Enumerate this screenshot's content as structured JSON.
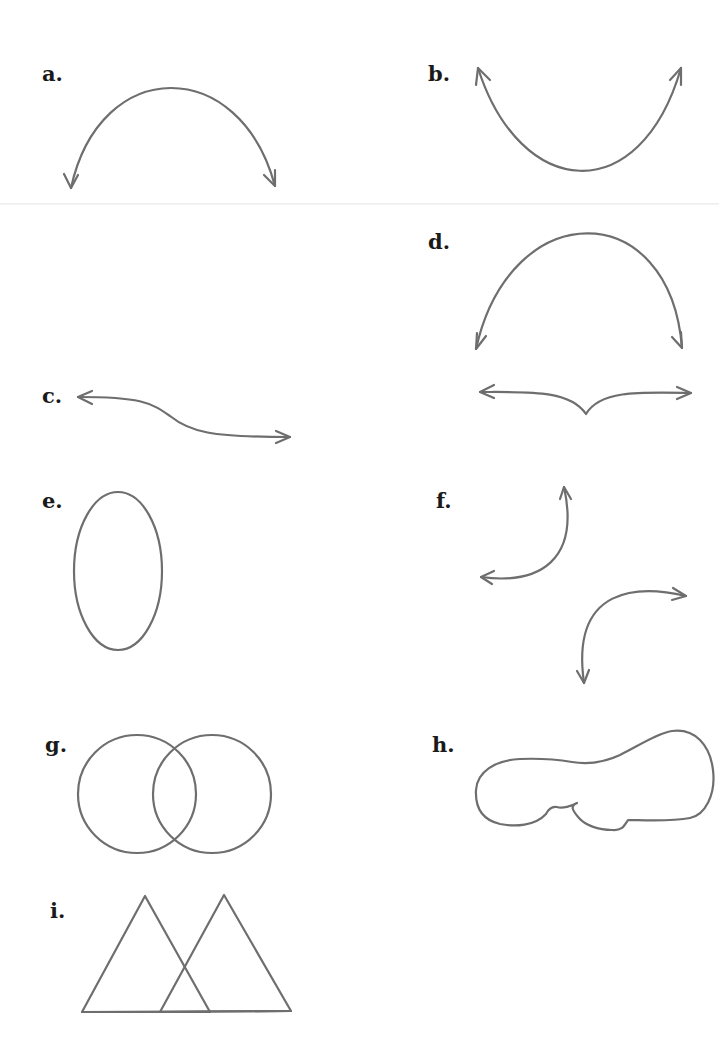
{
  "figures": [
    {
      "id": "a",
      "label": "a.",
      "shape": "downward-opening arc with arrowheads at both ends"
    },
    {
      "id": "b",
      "label": "b.",
      "shape": "upward-opening arc with arrowheads at both ends"
    },
    {
      "id": "c",
      "label": "c.",
      "shape": "S-shaped curve with arrowheads at both ends"
    },
    {
      "id": "d",
      "label": "d.",
      "shape": "downward-opening arc with arrows above a double-headed horizontal line with a downward cusp"
    },
    {
      "id": "e",
      "label": "e.",
      "shape": "vertical ellipse"
    },
    {
      "id": "f",
      "label": "f.",
      "shape": "two opposing quarter-circle curves with arrowheads at both ends"
    },
    {
      "id": "g",
      "label": "g.",
      "shape": "two overlapping circles"
    },
    {
      "id": "h",
      "label": "h.",
      "shape": "irregular closed blob shape"
    },
    {
      "id": "i",
      "label": "i.",
      "shape": "two overlapping triangles sharing a base line"
    }
  ],
  "colors": {
    "stroke": "#6e6e6e",
    "label": "#1a1a1a",
    "background": "#ffffff"
  }
}
